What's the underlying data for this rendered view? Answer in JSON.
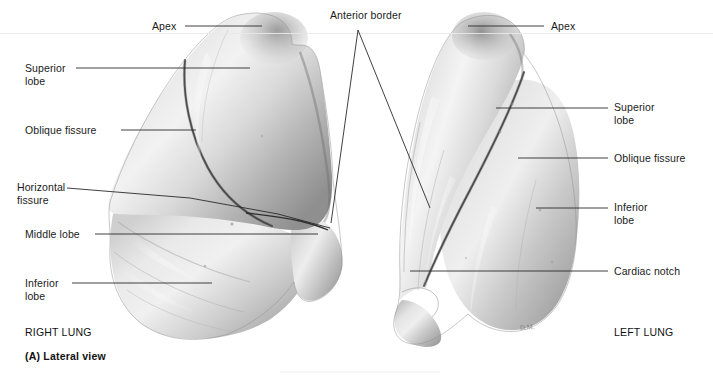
{
  "figure": {
    "background": "#ffffff",
    "ink": "#1a1a1a",
    "caption_letter": "(A) Lateral view",
    "view_type": "Lateral view"
  },
  "labels": {
    "apex_left": "Apex",
    "apex_right": "Apex",
    "anterior_border": "Anterior border",
    "superior_lobe_left": "Superior\nlobe",
    "oblique_fissure_left": "Oblique fissure",
    "horizontal_fissure": "Horizontal\nfissure",
    "middle_lobe": "Middle lobe",
    "inferior_lobe_left": "Inferior\nlobe",
    "superior_lobe_right": "Superior\nlobe",
    "oblique_fissure_right": "Oblique fissure",
    "inferior_lobe_right": "Inferior\nlobe",
    "cardiac_notch": "Cardiac notch",
    "right_lung": "RIGHT LUNG",
    "left_lung": "LEFT LUNG",
    "artist_signature": "D.M."
  },
  "specimens": [
    {
      "name": "right-lung",
      "side": "right",
      "lobes": [
        "Superior lobe",
        "Middle lobe",
        "Inferior lobe"
      ],
      "fissures": [
        "Oblique fissure",
        "Horizontal fissure"
      ],
      "features": [
        "Apex",
        "Anterior border"
      ]
    },
    {
      "name": "left-lung",
      "side": "left",
      "lobes": [
        "Superior lobe",
        "Inferior lobe"
      ],
      "fissures": [
        "Oblique fissure"
      ],
      "features": [
        "Apex",
        "Anterior border",
        "Cardiac notch"
      ]
    }
  ]
}
